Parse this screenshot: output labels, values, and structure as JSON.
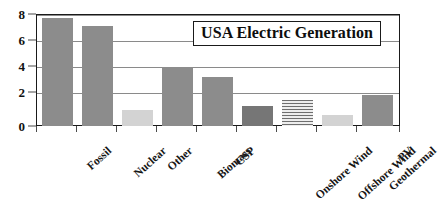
{
  "chart_data": {
    "type": "bar",
    "title": "USA Electric Generation",
    "xlabel": "",
    "ylabel": "",
    "ylim": [
      0,
      8.6
    ],
    "yticks": [
      0,
      2,
      4,
      6,
      8
    ],
    "ytick_labels": [
      "0",
      "2",
      "4",
      "6",
      "8"
    ],
    "grid": true,
    "grid_axis": "y",
    "legend": false,
    "legend_position": "none",
    "categories": [
      "Fossil",
      "Nuclear",
      "Other",
      "Biomass",
      "CSP",
      "Onshore Wind",
      "Offshore Wind",
      "Geothermal",
      "PV"
    ],
    "values": [
      8.3,
      7.7,
      1.2,
      4.5,
      3.75,
      1.55,
      2.0,
      0.85,
      2.4
    ],
    "bar_styles": [
      "solid-mid",
      "solid-mid",
      "solid-light",
      "solid-mid",
      "solid-mid",
      "solid-dark",
      "hatch",
      "solid-light",
      "solid-mid"
    ],
    "colors": {
      "solid-mid": "#8c8c8c",
      "solid-dark": "#767676",
      "solid-light": "#d3d3d3",
      "hatch": "#e6e6e6",
      "hatch_line": "#6e6e6e",
      "frame": "#1a1a1a",
      "grid": "#8a8a8a",
      "text": "#111111"
    }
  }
}
